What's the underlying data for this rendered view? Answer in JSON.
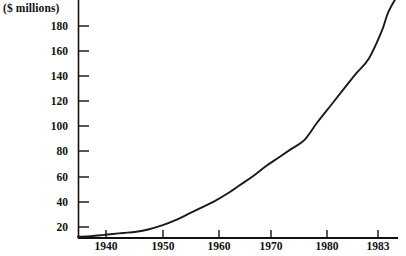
{
  "chart_data": {
    "type": "line",
    "title": "",
    "subtitle": "",
    "unit_label": "($ millions)",
    "xlabel": "",
    "ylabel": "",
    "grid": false,
    "legend": null,
    "xlim": [
      1935,
      1984.5
    ],
    "ylim": [
      0,
      198
    ],
    "x_ticks": [
      1940,
      1950,
      1960,
      1970,
      1980,
      1983
    ],
    "x_tick_labels": [
      "1940",
      "1950",
      "1960",
      "1970",
      "1980",
      "1983"
    ],
    "y_ticks": [
      20,
      40,
      60,
      80,
      100,
      120,
      140,
      160,
      180
    ],
    "y_tick_labels": [
      "20",
      "40",
      "60",
      "80",
      "100",
      "120",
      "140",
      "160",
      "180"
    ],
    "series": [
      {
        "name": "value",
        "x": [
          1935,
          1937,
          1939,
          1940,
          1942,
          1944,
          1946,
          1948,
          1950,
          1952,
          1954,
          1956,
          1958,
          1960,
          1962,
          1964,
          1966,
          1968,
          1970,
          1972,
          1974,
          1976,
          1978,
          1980,
          1982,
          1983,
          1984.5
        ],
        "values": [
          1,
          1.5,
          2.5,
          3,
          4,
          5,
          7,
          10,
          14,
          19,
          24,
          29,
          35,
          42,
          49,
          57,
          64,
          71,
          78,
          92,
          105,
          118,
          131,
          143,
          165,
          180,
          194
        ]
      }
    ]
  },
  "axes": {
    "unit_label": "($ millions)",
    "y_labels": [
      "180",
      "160",
      "140",
      "120",
      "100",
      "80",
      "60",
      "40",
      "20"
    ],
    "x_labels": [
      "1940",
      "1950",
      "1960",
      "1970",
      "1980",
      "1983"
    ]
  },
  "geometry": {
    "plot_left": 78,
    "plot_right": 398,
    "plot_bottom": 238,
    "x_of_1940": 106,
    "x_of_1950": 163,
    "x_of_1960": 219,
    "x_of_1970": 271,
    "x_of_1980": 327,
    "x_of_1983": 378,
    "y_of_20": 227,
    "y_of_180": 26,
    "pixels_per_20_units": 25.1
  },
  "colors": {
    "background": "#ffffff",
    "ink": "#111111",
    "curve": "#1a1a1a"
  }
}
